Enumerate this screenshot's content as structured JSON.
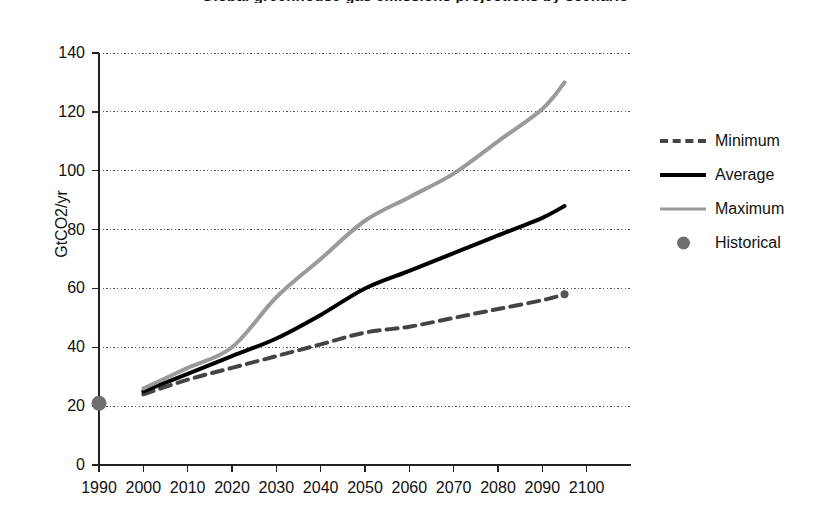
{
  "chart_data": {
    "type": "line",
    "title": "Global greenhouse gas emissions projections by scenario",
    "xlabel": "",
    "ylabel": "GtCO2/yr",
    "xlim": [
      1990,
      2110
    ],
    "ylim": [
      0,
      140
    ],
    "ytick_step": 20,
    "xtick_step": 10,
    "grid": "horizontal-dotted",
    "legend_position": "right",
    "xticks": [
      1990,
      2000,
      2010,
      2020,
      2030,
      2040,
      2050,
      2060,
      2070,
      2080,
      2090,
      2100
    ],
    "yticks": [
      0,
      20,
      40,
      60,
      80,
      100,
      120,
      140
    ],
    "x": [
      2000,
      2010,
      2020,
      2030,
      2040,
      2050,
      2060,
      2070,
      2080,
      2090,
      2095
    ],
    "series": [
      {
        "name": "Minimum",
        "style": "dashed",
        "color": "#444444",
        "width": 4,
        "values": [
          24,
          29,
          33,
          37,
          41,
          45,
          47,
          50,
          53,
          56,
          58
        ]
      },
      {
        "name": "Average",
        "style": "solid",
        "color": "#000000",
        "width": 4,
        "values": [
          25,
          31,
          37,
          43,
          51,
          60,
          66,
          72,
          78,
          84,
          88
        ]
      },
      {
        "name": "Maximum",
        "style": "solid",
        "color": "#9a9a9a",
        "width": 4,
        "values": [
          26,
          33,
          40,
          57,
          70,
          83,
          91,
          99,
          110,
          121,
          130
        ]
      },
      {
        "name": "Historical",
        "style": "marker",
        "color": "#6e6e6e",
        "width": 0,
        "points": [
          {
            "x": 1990,
            "y": 21
          }
        ]
      }
    ],
    "endpoint_markers": [
      {
        "series": "Minimum",
        "x": 2095,
        "y": 58,
        "color": "#555555"
      }
    ]
  },
  "legend": {
    "items": [
      {
        "label": "Minimum",
        "key": "dashed-line-key"
      },
      {
        "label": "Average",
        "key": "solid-black-line-key"
      },
      {
        "label": "Maximum",
        "key": "solid-gray-line-key"
      },
      {
        "label": "Historical",
        "key": "dot-marker-key"
      }
    ]
  }
}
